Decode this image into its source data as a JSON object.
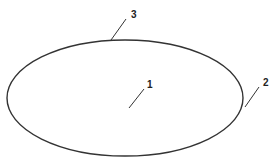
{
  "diagram": {
    "type": "patent-figure",
    "shape": {
      "kind": "ellipse",
      "cx": 125,
      "cy": 98,
      "rx": 118,
      "ry": 58,
      "stroke": "#333333",
      "stroke_width": 1.4
    },
    "references": [
      {
        "label": "1",
        "text_x": 147,
        "text_y": 88,
        "leader": {
          "x1": 144,
          "y1": 89,
          "x2": 129,
          "y2": 108
        }
      },
      {
        "label": "2",
        "text_x": 263,
        "text_y": 86,
        "leader": {
          "x1": 259,
          "y1": 87,
          "x2": 245,
          "y2": 107
        }
      },
      {
        "label": "3",
        "text_x": 131,
        "text_y": 18,
        "leader": {
          "x1": 126,
          "y1": 19,
          "x2": 111,
          "y2": 40
        }
      }
    ],
    "colors": {
      "line": "#333333",
      "text": "#222222",
      "background": "#ffffff"
    }
  }
}
